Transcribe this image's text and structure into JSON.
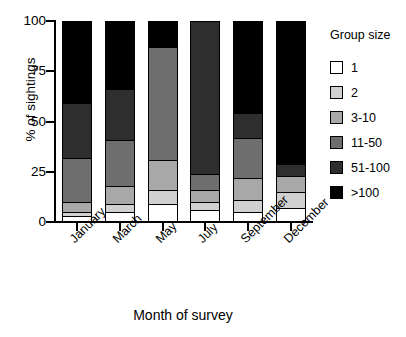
{
  "chart_data": {
    "type": "bar",
    "subtype": "stacked-percent",
    "title": "",
    "xlabel": "Month of survey",
    "ylabel": "% of sightings",
    "categories": [
      "January",
      "March",
      "May",
      "July",
      "September",
      "December"
    ],
    "ylim": [
      0,
      100
    ],
    "yticks": [
      0,
      25,
      50,
      75,
      100
    ],
    "ytick_labels": [
      "0",
      "25",
      "50",
      "75",
      "100"
    ],
    "grid": false,
    "legend_title": "Group size",
    "legend_position": "right",
    "series": [
      {
        "name": "1",
        "color": "#ffffff",
        "values": [
          2,
          4,
          8,
          5,
          4,
          6
        ]
      },
      {
        "name": "2",
        "color": "#d0d0d0",
        "values": [
          2,
          4,
          7,
          4,
          6,
          8
        ]
      },
      {
        "name": "3-10",
        "color": "#a8a8a8",
        "values": [
          5,
          9,
          15,
          6,
          11,
          8
        ]
      },
      {
        "name": "11-50",
        "color": "#6e6e6e",
        "values": [
          22,
          23,
          57,
          8,
          20,
          0
        ]
      },
      {
        "name": "51-100",
        "color": "#2e2e2e",
        "values": [
          28,
          26,
          0,
          77,
          13,
          6
        ]
      },
      {
        "name": ">100",
        "color": "#000000",
        "values": [
          41,
          34,
          13,
          0,
          46,
          72
        ]
      }
    ]
  },
  "axis": {
    "ylabel": "% of sightings",
    "xlabel": "Month of survey"
  },
  "legend": {
    "title": "Group size",
    "items": [
      {
        "label": "1",
        "color": "#ffffff"
      },
      {
        "label": "2",
        "color": "#d0d0d0"
      },
      {
        "label": "3-10",
        "color": "#a8a8a8"
      },
      {
        "label": "11-50",
        "color": "#6e6e6e"
      },
      {
        "label": "51-100",
        "color": "#2e2e2e"
      },
      {
        "label": ">100",
        "color": "#000000"
      }
    ]
  }
}
